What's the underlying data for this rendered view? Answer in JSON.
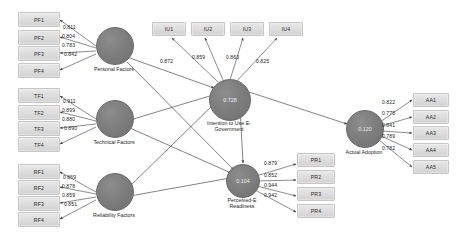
{
  "diagram": {
    "constructs": {
      "personal_factors": {
        "name": "Personal Factors",
        "r2": ""
      },
      "technical_factors": {
        "name": "Technical Factors",
        "r2": ""
      },
      "reliability_factors": {
        "name": "Reliability Factors",
        "r2": ""
      },
      "intention": {
        "name": "Intention to Use E-\nGovernment",
        "r2": "0.728"
      },
      "readiness": {
        "name": "Perceived-E\nReadiness",
        "r2": "0.104"
      },
      "adoption": {
        "name": "Actual Adoption",
        "r2": "0.120"
      }
    },
    "indicators": {
      "pf": [
        "PF1",
        "PF2",
        "PF3",
        "PF4"
      ],
      "tf": [
        "TF1",
        "TF2",
        "TF3",
        "TF4"
      ],
      "rf": [
        "RF1",
        "RF2",
        "RF3",
        "RF4"
      ],
      "iu": [
        "IU1",
        "IU2",
        "IU3",
        "IU4"
      ],
      "pr": [
        "PR1",
        "PR2",
        "PR3",
        "PR4"
      ],
      "aa": [
        "AA1",
        "AA2",
        "AA3",
        "AA4",
        "AA5"
      ]
    },
    "loadings": {
      "pf": [
        "0.811",
        "0.804",
        "0.783",
        "0.842"
      ],
      "tf": [
        "0.911",
        "0.899",
        "0.880",
        "0.890"
      ],
      "rf": [
        "0.869",
        "0.878",
        "0.859",
        "0.851"
      ],
      "iu": [
        "0.872",
        "0.859",
        "0.863",
        "0.825"
      ],
      "pr": [
        "0.879",
        "0.852",
        "0.944",
        "0.942"
      ],
      "aa": [
        "0.822",
        "0.775",
        "0.841",
        "0.789",
        "0.782"
      ]
    },
    "colors": {
      "construct_fill": "#7e7e7e",
      "indicator_fill": "#dcdcdc",
      "path_stroke": "#4a4a4a",
      "background": "#ffffff"
    }
  }
}
